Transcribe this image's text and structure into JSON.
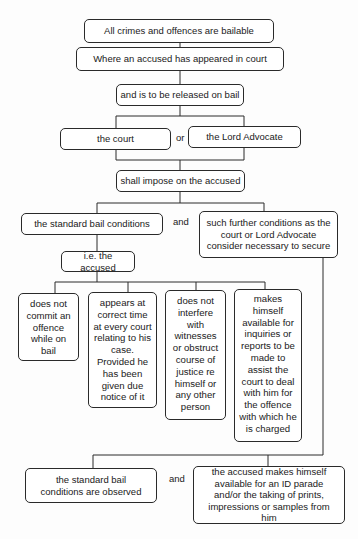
{
  "diagram": {
    "nodes": {
      "all_bailable": "All crimes and offences are bailable",
      "appeared": "Where an accused has appeared in court",
      "released": "and is to be released on bail",
      "court": "the court",
      "lord_advocate": "the Lord Advocate",
      "impose": "shall impose on the accused",
      "standard": "the standard bail conditions",
      "further": "such further conditions as the court or Lord Advocate consider necessary to secure",
      "ie_accused": "i.e. the accused",
      "cond_1": "does not commit an offence while on bail",
      "cond_2": "appears at correct time at every court relating to his case. Provided he has been given due notice of it",
      "cond_3": "does not interfere with witnesses or obstruct course of justice re himself or any other person",
      "cond_4": "makes himself available for inquiries or reports to be made to assist the court to deal with him for the offence with which he is charged",
      "observed": "the standard bail conditions are observed",
      "id_parade": "the accused makes himself available for an ID parade and/or the taking of prints, impressions or samples from him"
    },
    "connectors": {
      "or": "or",
      "and_1": "and",
      "and_2": "and"
    }
  }
}
